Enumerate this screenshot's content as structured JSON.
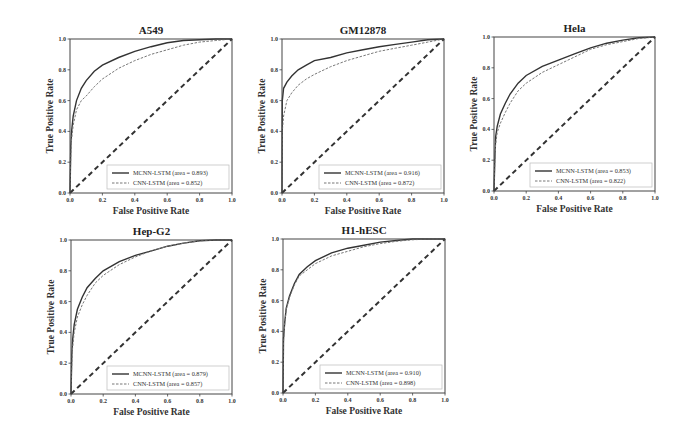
{
  "chart_data": [
    {
      "type": "line",
      "title": "A549",
      "xlabel": "False Positive Rate",
      "ylabel": "True Positive Rate",
      "xlim": [
        0,
        1
      ],
      "ylim": [
        0,
        1
      ],
      "xticks": [
        "0.0",
        "0.2",
        "0.4",
        "0.6",
        "0.8",
        "1.0"
      ],
      "yticks": [
        "0.0",
        "0.2",
        "0.4",
        "0.6",
        "0.8",
        "1.0"
      ],
      "legend_position": "bottom-right",
      "series": [
        {
          "name": "MCNN-LSTM (area = 0.893)",
          "style": "solid",
          "x": [
            0,
            0.005,
            0.01,
            0.02,
            0.04,
            0.07,
            0.1,
            0.15,
            0.2,
            0.3,
            0.4,
            0.5,
            0.6,
            0.7,
            0.8,
            0.9,
            1.0
          ],
          "y": [
            0,
            0.3,
            0.4,
            0.5,
            0.6,
            0.68,
            0.73,
            0.79,
            0.83,
            0.88,
            0.92,
            0.95,
            0.975,
            0.99,
            0.995,
            1.0,
            1.0
          ]
        },
        {
          "name": "CNN-LSTM (area = 0.852)",
          "style": "dashed",
          "x": [
            0,
            0.005,
            0.01,
            0.02,
            0.04,
            0.07,
            0.1,
            0.15,
            0.2,
            0.3,
            0.4,
            0.5,
            0.6,
            0.7,
            0.8,
            0.9,
            1.0
          ],
          "y": [
            0,
            0.25,
            0.35,
            0.44,
            0.54,
            0.6,
            0.63,
            0.69,
            0.74,
            0.81,
            0.86,
            0.9,
            0.93,
            0.96,
            0.98,
            0.99,
            1.0
          ]
        },
        {
          "name": "chance",
          "style": "diagonal",
          "x": [
            0,
            1
          ],
          "y": [
            0,
            1
          ]
        }
      ]
    },
    {
      "type": "line",
      "title": "GM12878",
      "xlabel": "False Positive Rate",
      "ylabel": "True Positive Rate",
      "xlim": [
        0,
        1
      ],
      "ylim": [
        0,
        1
      ],
      "xticks": [
        "0.0",
        "0.2",
        "0.4",
        "0.6",
        "0.8",
        "1.0"
      ],
      "yticks": [
        "0.0",
        "0.2",
        "0.4",
        "0.6",
        "0.8",
        "1.0"
      ],
      "legend_position": "bottom-right",
      "series": [
        {
          "name": "MCNN-LSTM (area = 0.916)",
          "style": "solid",
          "x": [
            0,
            0.002,
            0.01,
            0.03,
            0.06,
            0.1,
            0.15,
            0.2,
            0.3,
            0.4,
            0.5,
            0.6,
            0.7,
            0.8,
            0.9,
            1.0
          ],
          "y": [
            0,
            0.6,
            0.68,
            0.72,
            0.76,
            0.8,
            0.83,
            0.86,
            0.88,
            0.91,
            0.93,
            0.95,
            0.965,
            0.98,
            0.995,
            1.0
          ]
        },
        {
          "name": "CNN-LSTM (area = 0.872)",
          "style": "dashed",
          "x": [
            0,
            0.002,
            0.01,
            0.03,
            0.06,
            0.1,
            0.15,
            0.2,
            0.3,
            0.4,
            0.5,
            0.6,
            0.7,
            0.8,
            0.9,
            1.0
          ],
          "y": [
            0,
            0.4,
            0.5,
            0.6,
            0.65,
            0.7,
            0.74,
            0.77,
            0.82,
            0.86,
            0.89,
            0.92,
            0.94,
            0.96,
            0.98,
            1.0
          ]
        },
        {
          "name": "chance",
          "style": "diagonal",
          "x": [
            0,
            1
          ],
          "y": [
            0,
            1
          ]
        }
      ]
    },
    {
      "type": "line",
      "title": "Hela",
      "xlabel": "False Positive Rate",
      "ylabel": "True Positive Rate",
      "xlim": [
        0,
        1
      ],
      "ylim": [
        0,
        1
      ],
      "xticks": [
        "0.0",
        "0.2",
        "0.4",
        "0.6",
        "0.8",
        "1.0"
      ],
      "yticks": [
        "0.0",
        "0.2",
        "0.4",
        "0.6",
        "0.8",
        "1.0"
      ],
      "legend_position": "bottom-right",
      "series": [
        {
          "name": "MCNN-LSTM (area = 0.853)",
          "style": "solid",
          "x": [
            0,
            0.005,
            0.01,
            0.02,
            0.04,
            0.07,
            0.1,
            0.15,
            0.2,
            0.3,
            0.4,
            0.5,
            0.6,
            0.7,
            0.8,
            0.9,
            1.0
          ],
          "y": [
            0,
            0.2,
            0.35,
            0.42,
            0.5,
            0.57,
            0.63,
            0.7,
            0.75,
            0.81,
            0.85,
            0.89,
            0.93,
            0.96,
            0.98,
            0.995,
            1.0
          ]
        },
        {
          "name": "CNN-LSTM (area = 0.822)",
          "style": "dashed",
          "x": [
            0,
            0.005,
            0.01,
            0.02,
            0.04,
            0.07,
            0.1,
            0.15,
            0.2,
            0.3,
            0.4,
            0.5,
            0.6,
            0.7,
            0.8,
            0.9,
            1.0
          ],
          "y": [
            0,
            0.18,
            0.3,
            0.38,
            0.44,
            0.51,
            0.57,
            0.65,
            0.7,
            0.77,
            0.82,
            0.87,
            0.92,
            0.95,
            0.97,
            0.99,
            1.0
          ]
        },
        {
          "name": "chance",
          "style": "diagonal",
          "x": [
            0,
            1
          ],
          "y": [
            0,
            1
          ]
        }
      ]
    },
    {
      "type": "line",
      "title": "Hep-G2",
      "xlabel": "False Positive Rate",
      "ylabel": "True Positive Rate",
      "xlim": [
        0,
        1
      ],
      "ylim": [
        0,
        1
      ],
      "xticks": [
        "0.0",
        "0.2",
        "0.4",
        "0.6",
        "0.8",
        "1.0"
      ],
      "yticks": [
        "0.0",
        "0.2",
        "0.4",
        "0.6",
        "0.8",
        "1.0"
      ],
      "legend_position": "bottom-right",
      "series": [
        {
          "name": "MCNN-LSTM (area = 0.879)",
          "style": "solid",
          "x": [
            0,
            0.005,
            0.01,
            0.02,
            0.04,
            0.07,
            0.1,
            0.15,
            0.2,
            0.3,
            0.4,
            0.5,
            0.6,
            0.7,
            0.8,
            0.9,
            1.0
          ],
          "y": [
            0,
            0.25,
            0.35,
            0.45,
            0.55,
            0.63,
            0.69,
            0.75,
            0.8,
            0.86,
            0.9,
            0.93,
            0.96,
            0.98,
            0.995,
            1.0,
            1.0
          ]
        },
        {
          "name": "CNN-LSTM (area = 0.857)",
          "style": "dashed",
          "x": [
            0,
            0.005,
            0.01,
            0.02,
            0.04,
            0.07,
            0.1,
            0.15,
            0.2,
            0.3,
            0.4,
            0.5,
            0.6,
            0.7,
            0.8,
            0.9,
            1.0
          ],
          "y": [
            0,
            0.2,
            0.3,
            0.4,
            0.5,
            0.58,
            0.64,
            0.72,
            0.77,
            0.84,
            0.89,
            0.93,
            0.96,
            0.98,
            0.995,
            1.0,
            1.0
          ]
        },
        {
          "name": "chance",
          "style": "diagonal",
          "x": [
            0,
            1
          ],
          "y": [
            0,
            1
          ]
        }
      ]
    },
    {
      "type": "line",
      "title": "H1-hESC",
      "xlabel": "False Positive Rate",
      "ylabel": "True Positive Rate",
      "xlim": [
        0,
        1
      ],
      "ylim": [
        0,
        1
      ],
      "xticks": [
        "0.0",
        "0.2",
        "0.4",
        "0.6",
        "0.8",
        "1.0"
      ],
      "yticks": [
        "0.0",
        "0.2",
        "0.4",
        "0.6",
        "0.8",
        "1.0"
      ],
      "legend_position": "bottom-right",
      "series": [
        {
          "name": "MCNN-LSTM (area = 0.910)",
          "style": "solid",
          "x": [
            0,
            0.003,
            0.01,
            0.02,
            0.04,
            0.07,
            0.1,
            0.15,
            0.2,
            0.3,
            0.4,
            0.5,
            0.6,
            0.7,
            0.8,
            0.9,
            1.0
          ],
          "y": [
            0,
            0.35,
            0.45,
            0.55,
            0.63,
            0.71,
            0.77,
            0.82,
            0.86,
            0.91,
            0.94,
            0.96,
            0.98,
            0.99,
            1.0,
            1.0,
            1.0
          ]
        },
        {
          "name": "CNN-LSTM (area = 0.898)",
          "style": "dashed",
          "x": [
            0,
            0.003,
            0.01,
            0.02,
            0.04,
            0.07,
            0.1,
            0.15,
            0.2,
            0.3,
            0.4,
            0.5,
            0.6,
            0.7,
            0.8,
            0.9,
            1.0
          ],
          "y": [
            0,
            0.33,
            0.44,
            0.54,
            0.62,
            0.7,
            0.76,
            0.8,
            0.84,
            0.89,
            0.92,
            0.95,
            0.97,
            0.985,
            0.995,
            1.0,
            1.0
          ]
        },
        {
          "name": "chance",
          "style": "diagonal",
          "x": [
            0,
            1
          ],
          "y": [
            0,
            1
          ]
        }
      ]
    }
  ]
}
